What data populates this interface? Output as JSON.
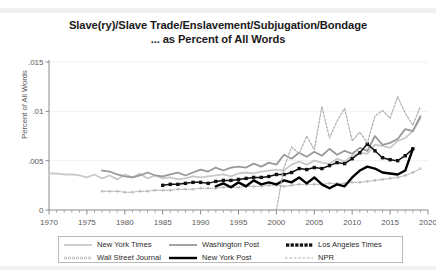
{
  "chart_data": {
    "type": "line",
    "title": "Slave(ry)/Slave Trade/Enslavement/Subjugation/Bondage",
    "subtitle": "... as Percent of All Words",
    "xlabel": "",
    "ylabel": "Percent of All Words",
    "xlim": [
      1970,
      2020
    ],
    "ylim": [
      0,
      0.015
    ],
    "grid": "horizontal",
    "legend_position": "bottom",
    "ytick_labels": [
      "0",
      ".005",
      ".01",
      ".015"
    ],
    "ytick_values": [
      0,
      0.005,
      0.01,
      0.015
    ],
    "xtick_labels": [
      "1970",
      "1975",
      "1980",
      "1985",
      "1990",
      "1995",
      "2000",
      "2005",
      "2010",
      "2015",
      "2020"
    ],
    "xtick_values": [
      1970,
      1975,
      1980,
      1985,
      1990,
      1995,
      2000,
      2005,
      2010,
      2015,
      2020
    ],
    "xminor_step": 1,
    "series": [
      {
        "name": "New York Times",
        "color": "#c9c9c9",
        "style": "solid",
        "marker": "none",
        "width": 1.8,
        "x": [
          1970,
          1971,
          1972,
          1973,
          1974,
          1975,
          1976,
          1977,
          1978,
          1979,
          1980,
          1981,
          1982,
          1983,
          1984,
          1985,
          1986,
          1987,
          1988,
          1989,
          1990,
          1991,
          1992,
          1993,
          1994,
          1995,
          1996,
          1997,
          1998,
          1999,
          2000,
          2001,
          2002,
          2003,
          2004,
          2005,
          2006,
          2007,
          2008,
          2009,
          2010,
          2011,
          2012,
          2013,
          2014,
          2015,
          2016,
          2017,
          2018,
          2019
        ],
        "y": [
          0.0037,
          0.0037,
          0.0036,
          0.0036,
          0.0035,
          0.0033,
          0.0036,
          0.0032,
          0.0035,
          0.0031,
          0.0036,
          0.0033,
          0.0037,
          0.0032,
          0.0035,
          0.0032,
          0.0033,
          0.0031,
          0.0032,
          0.0034,
          0.0033,
          0.0034,
          0.0035,
          0.0036,
          0.0034,
          0.0037,
          0.0038,
          0.0037,
          0.0039,
          0.004,
          0.0041,
          0.004,
          0.0046,
          0.0049,
          0.0046,
          0.005,
          0.0048,
          0.0047,
          0.0052,
          0.0049,
          0.0055,
          0.0058,
          0.0057,
          0.0066,
          0.0065,
          0.0063,
          0.007,
          0.0073,
          0.008,
          0.0093
        ]
      },
      {
        "name": "Washington Post",
        "color": "#999999",
        "style": "solid",
        "marker": "none",
        "width": 1.8,
        "x": [
          1977,
          1978,
          1979,
          1980,
          1981,
          1982,
          1983,
          1984,
          1985,
          1986,
          1987,
          1988,
          1989,
          1990,
          1991,
          1992,
          1993,
          1994,
          1995,
          1996,
          1997,
          1998,
          1999,
          2000,
          2001,
          2002,
          2003,
          2004,
          2005,
          2006,
          2007,
          2008,
          2009,
          2010,
          2011,
          2012,
          2013,
          2014,
          2015,
          2016,
          2017,
          2018,
          2019
        ],
        "y": [
          0.004,
          0.0039,
          0.0036,
          0.0034,
          0.0033,
          0.0035,
          0.0038,
          0.0035,
          0.0034,
          0.0036,
          0.0038,
          0.0035,
          0.0038,
          0.0041,
          0.0039,
          0.0043,
          0.004,
          0.0043,
          0.0044,
          0.0043,
          0.0047,
          0.0044,
          0.0048,
          0.0046,
          0.0056,
          0.0052,
          0.0058,
          0.0054,
          0.0059,
          0.0055,
          0.0062,
          0.0056,
          0.006,
          0.0057,
          0.0063,
          0.006,
          0.0075,
          0.0066,
          0.0068,
          0.0072,
          0.0082,
          0.008,
          0.0095
        ]
      },
      {
        "name": "Los Angeles Times",
        "color": "#111111",
        "style": "solid",
        "marker": "square",
        "width": 1.5,
        "x": [
          1985,
          1986,
          1987,
          1988,
          1989,
          1990,
          1991,
          1992,
          1993,
          1994,
          1995,
          1996,
          1997,
          1998,
          1999,
          2000,
          2001,
          2002,
          2003,
          2004,
          2005,
          2006,
          2007,
          2008,
          2009,
          2010,
          2011,
          2012,
          2013,
          2014,
          2015,
          2016,
          2017,
          2018
        ],
        "y": [
          0.0025,
          0.0026,
          0.0026,
          0.0027,
          0.0028,
          0.0028,
          0.0027,
          0.0029,
          0.003,
          0.003,
          0.0031,
          0.0032,
          0.0033,
          0.0033,
          0.0034,
          0.0036,
          0.0036,
          0.0038,
          0.0042,
          0.0041,
          0.0043,
          0.0042,
          0.0045,
          0.0048,
          0.0047,
          0.0052,
          0.0058,
          0.0067,
          0.006,
          0.0053,
          0.0051,
          0.005,
          0.0055,
          0.0062
        ]
      },
      {
        "name": "Wall Street Journal",
        "color": "#a8a8a8",
        "style": "dotted",
        "marker": "circle-small",
        "width": 1.0,
        "x": [
          1977,
          1978,
          1979,
          1980,
          1981,
          1982,
          1983,
          1984,
          1985,
          1986,
          1987,
          1988,
          1989,
          1990,
          1991,
          1992,
          1993,
          1994,
          1995,
          1996,
          1997,
          1998,
          1999,
          2000,
          2001,
          2002,
          2003,
          2004,
          2005,
          2006,
          2007,
          2008,
          2009,
          2010,
          2011,
          2012,
          2013,
          2014,
          2015,
          2016,
          2017,
          2018,
          2019
        ],
        "y": [
          0.0019,
          0.0019,
          0.0019,
          0.0018,
          0.0018,
          0.0019,
          0.0019,
          0.002,
          0.002,
          0.002,
          0.0021,
          0.0021,
          0.0021,
          0.0022,
          0.0022,
          0.0022,
          0.0023,
          0.0023,
          0.0023,
          0.0024,
          0.0024,
          0.0024,
          0.0025,
          0.0025,
          0.0024,
          0.0025,
          0.0026,
          0.0026,
          0.0026,
          0.0026,
          0.0027,
          0.0027,
          0.0027,
          0.0028,
          0.0028,
          0.0029,
          0.003,
          0.0031,
          0.0032,
          0.0033,
          0.0035,
          0.0038,
          0.0042
        ]
      },
      {
        "name": "New York Post",
        "color": "#000000",
        "style": "solid",
        "marker": "none",
        "width": 2.4,
        "x": [
          1992,
          1993,
          1994,
          1995,
          1996,
          1997,
          1998,
          1999,
          2000,
          2001,
          2002,
          2003,
          2004,
          2005,
          2006,
          2007,
          2008,
          2009,
          2010,
          2011,
          2012,
          2013,
          2014,
          2015,
          2016,
          2017,
          2018
        ],
        "y": [
          0.0024,
          0.0027,
          0.0023,
          0.0028,
          0.0024,
          0.003,
          0.0026,
          0.0028,
          0.0026,
          0.003,
          0.0028,
          0.0033,
          0.0027,
          0.0033,
          0.0026,
          0.0022,
          0.0026,
          0.0024,
          0.0033,
          0.004,
          0.0044,
          0.0042,
          0.0038,
          0.0037,
          0.0036,
          0.004,
          0.0062
        ]
      },
      {
        "name": "NPR",
        "color": "#b0b0b0",
        "style": "dashed",
        "marker": "none",
        "width": 1.2,
        "x": [
          1999,
          2000,
          2001,
          2002,
          2003,
          2004,
          2005,
          2006,
          2007,
          2008,
          2009,
          2010,
          2011,
          2012,
          2013,
          2014,
          2015,
          2016,
          2017,
          2018,
          2019
        ],
        "y": [
          0.0,
          0.0,
          0.0043,
          0.0064,
          0.0057,
          0.0075,
          0.0061,
          0.0105,
          0.0073,
          0.009,
          0.0103,
          0.007,
          0.0079,
          0.0068,
          0.0095,
          0.0101,
          0.0093,
          0.0115,
          0.0098,
          0.0086,
          0.0105
        ]
      }
    ]
  },
  "legend": {
    "entries": [
      {
        "label": "New York Times",
        "key": "line-light-gray"
      },
      {
        "label": "Washington Post",
        "key": "line-medium-gray"
      },
      {
        "label": "Los Angeles Times",
        "key": "squares-black"
      },
      {
        "label": "Wall Street Journal",
        "key": "dots-small-gray"
      },
      {
        "label": "New York Post",
        "key": "line-thick-black"
      },
      {
        "label": "NPR",
        "key": "dashes-gray"
      }
    ]
  }
}
